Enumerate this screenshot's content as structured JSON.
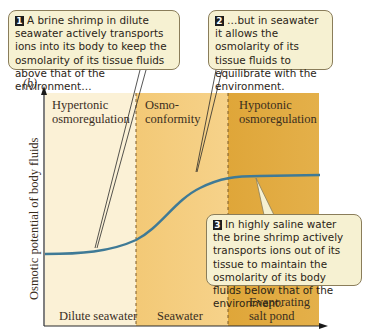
{
  "figure": {
    "panel_label": "(b)",
    "y_axis_title": "Osmotic potential of body fluids",
    "regions": [
      {
        "id": "hypertonic",
        "label_line1": "Hypertonic",
        "label_line2": "osmoregulation",
        "bottom_line1": "Dilute seawater",
        "bottom_line2": "",
        "color": "#fbf1d6"
      },
      {
        "id": "conformity",
        "label_line1": "Osmo-",
        "label_line2": "conformity",
        "bottom_line1": "Seawater",
        "bottom_line2": "",
        "color": "#f4cd7c"
      },
      {
        "id": "hypotonic",
        "label_line1": "Hypotonic",
        "label_line2": "osmoregulation",
        "bottom_line1": "Evaporating",
        "bottom_line2": "salt pond",
        "color": "#e2ac3e"
      }
    ],
    "curve_color": "#3f7a96",
    "callouts": [
      {
        "number": "1",
        "text": "A brine shrimp in dilute seawater actively transports ions into its body to keep the osmolarity of its tissue fluids above that of the environment…"
      },
      {
        "number": "2",
        "text": "…but in seawater it allows the osmolarity of its tissue fluids to equilibrate with the environment."
      },
      {
        "number": "3",
        "text": "In highly saline water the brine shrimp actively transports ions out of its tissue to maintain the osmolarity of its body fluids below that of the environment."
      }
    ]
  }
}
